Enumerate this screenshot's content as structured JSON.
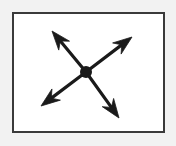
{
  "figure": {
    "title": "four-way radiating arrows diagram",
    "canvas": {
      "width": 176,
      "height": 146,
      "background_color": "#f2f2f2"
    },
    "panel": {
      "name": "bordered panel",
      "x": 12,
      "y": 12,
      "width": 153,
      "height": 121,
      "fill_color": "#ffffff",
      "border_color": "#3a3a3a",
      "border_width": 2
    },
    "center_node": {
      "label": "center dot",
      "cx": 86,
      "cy": 72,
      "radius": 6,
      "color": "#1a1a1a"
    },
    "stroke_color": "#1a1a1a",
    "stroke_width": 3.2,
    "arrows": [
      {
        "name": "arrow-up-left",
        "direction": "up-left",
        "from_x": 86,
        "from_y": 72,
        "to_x": 52,
        "to_y": 31,
        "angle_deg": 230
      },
      {
        "name": "arrow-up-right",
        "direction": "up-right",
        "from_x": 86,
        "from_y": 72,
        "to_x": 132,
        "to_y": 37,
        "angle_deg": 323
      },
      {
        "name": "arrow-down-left",
        "direction": "down-left",
        "from_x": 86,
        "from_y": 72,
        "to_x": 41,
        "to_y": 106,
        "angle_deg": 143
      },
      {
        "name": "arrow-down-right",
        "direction": "down-right",
        "from_x": 86,
        "from_y": 72,
        "to_x": 119,
        "to_y": 118,
        "angle_deg": 54
      }
    ],
    "arrowhead": {
      "style": "barbed-swallowtail",
      "length": 19,
      "half_width": 7,
      "notch_depth": 6
    }
  }
}
